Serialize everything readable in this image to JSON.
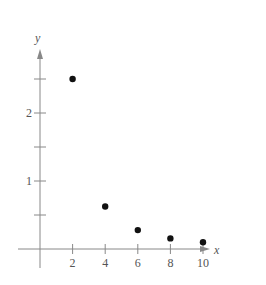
{
  "chart_data": {
    "type": "scatter",
    "title": "",
    "xlabel": "x",
    "ylabel": "y",
    "x": [
      2,
      4,
      6,
      8,
      10
    ],
    "values": [
      2.5,
      0.625,
      0.278,
      0.156,
      0.1
    ],
    "series": [
      {
        "name": "points",
        "x": [
          2,
          4,
          6,
          8,
          10
        ],
        "values": [
          2.5,
          0.625,
          0.278,
          0.156,
          0.1
        ]
      }
    ],
    "xticks": [
      2,
      4,
      6,
      8,
      10
    ],
    "xtick_labels": [
      "2",
      "4",
      "6",
      "8",
      "10"
    ],
    "yticks": [
      0.5,
      1,
      1.5,
      2,
      2.5
    ],
    "ytick_labels": [
      "",
      "1",
      "",
      "2",
      ""
    ],
    "xlim": [
      -0.5,
      11.5
    ],
    "ylim": [
      -0.2,
      3.0
    ],
    "grid": false,
    "legend": null,
    "colors": {
      "axis": "#888888",
      "point": "#111111",
      "text": "#555555"
    }
  },
  "axes": {
    "x_label": "x",
    "y_label": "y"
  }
}
